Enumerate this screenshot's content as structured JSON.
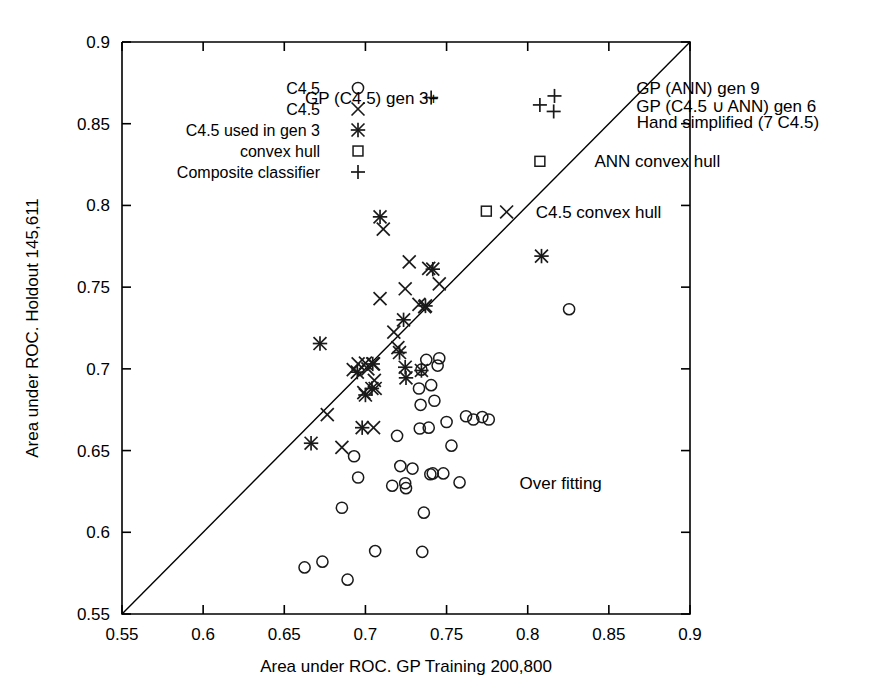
{
  "chart_data": {
    "type": "scatter",
    "title": "",
    "xlabel": "Area under ROC. GP Training 200,800",
    "ylabel": "Area under ROC. Holdout 145,611",
    "xlim": [
      0.55,
      0.9
    ],
    "ylim": [
      0.55,
      0.9
    ],
    "xticks": [
      "0.55",
      "0.6",
      "0.65",
      "0.7",
      "0.75",
      "0.8",
      "0.85",
      "0.9"
    ],
    "yticks": [
      "0.55",
      "0.6",
      "0.65",
      "0.7",
      "0.75",
      "0.8",
      "0.85",
      "0.9"
    ],
    "xtick_values": [
      0.55,
      0.6,
      0.65,
      0.7,
      0.75,
      0.8,
      0.85,
      0.9
    ],
    "ytick_values": [
      0.55,
      0.6,
      0.65,
      0.7,
      0.75,
      0.8,
      0.85,
      0.9
    ],
    "grid": false,
    "legend_position": "top-left",
    "reference_line": {
      "name": "y = x diagonal",
      "from": [
        0.55,
        0.55
      ],
      "to": [
        0.9,
        0.9
      ]
    },
    "legend": [
      {
        "label": "C4.5",
        "marker": "circle"
      },
      {
        "label": "C4.5",
        "marker": "cross"
      },
      {
        "label": "C4.5 used in gen 3",
        "marker": "star"
      },
      {
        "label": "convex hull",
        "marker": "square"
      },
      {
        "label": "Composite classifier",
        "marker": "plus"
      }
    ],
    "annotations": [
      {
        "text": "GP (C4.5) gen 3+",
        "x": 0.745,
        "y": 0.866
      },
      {
        "text": "GP (ANN) gen 9",
        "x": 0.862,
        "y": 0.872
      },
      {
        "text": "GP (C4.5 ∪ ANN) gen 6",
        "x": 0.862,
        "y": 0.861
      },
      {
        "text": "Hand simplified (7 C4.5)",
        "x": 0.866,
        "y": 0.851
      },
      {
        "text": "ANN convex hull",
        "x": 0.835,
        "y": 0.827
      },
      {
        "text": "C4.5 convex hull",
        "x": 0.8,
        "y": 0.796
      },
      {
        "text": "Over fitting",
        "x": 0.795,
        "y": 0.63
      }
    ],
    "series": [
      {
        "name": "C4.5",
        "marker": "circle",
        "points": [
          [
            0.6625,
            0.5785
          ],
          [
            0.6735,
            0.582
          ],
          [
            0.6855,
            0.615
          ],
          [
            0.689,
            0.571
          ],
          [
            0.693,
            0.6465
          ],
          [
            0.6955,
            0.6335
          ],
          [
            0.706,
            0.5885
          ],
          [
            0.7165,
            0.6285
          ],
          [
            0.7195,
            0.659
          ],
          [
            0.7215,
            0.6405
          ],
          [
            0.7245,
            0.63
          ],
          [
            0.725,
            0.627
          ],
          [
            0.729,
            0.639
          ],
          [
            0.733,
            0.688
          ],
          [
            0.7335,
            0.6635
          ],
          [
            0.734,
            0.678
          ],
          [
            0.7345,
            0.6995
          ],
          [
            0.735,
            0.588
          ],
          [
            0.736,
            0.612
          ],
          [
            0.7375,
            0.7055
          ],
          [
            0.739,
            0.664
          ],
          [
            0.74,
            0.6355
          ],
          [
            0.7405,
            0.69
          ],
          [
            0.7415,
            0.636
          ],
          [
            0.7425,
            0.6805
          ],
          [
            0.7445,
            0.702
          ],
          [
            0.7455,
            0.7065
          ],
          [
            0.748,
            0.636
          ],
          [
            0.75,
            0.6675
          ],
          [
            0.753,
            0.653
          ],
          [
            0.758,
            0.6305
          ],
          [
            0.762,
            0.671
          ],
          [
            0.7665,
            0.669
          ],
          [
            0.772,
            0.6705
          ],
          [
            0.776,
            0.669
          ],
          [
            0.8255,
            0.7365
          ]
        ]
      },
      {
        "name": "C4.5 cross",
        "marker": "cross",
        "points": [
          [
            0.6765,
            0.672
          ],
          [
            0.6855,
            0.652
          ],
          [
            0.6925,
            0.6995
          ],
          [
            0.6955,
            0.703
          ],
          [
            0.699,
            0.6855
          ],
          [
            0.7,
            0.7035
          ],
          [
            0.7015,
            0.7
          ],
          [
            0.705,
            0.703
          ],
          [
            0.7055,
            0.693
          ],
          [
            0.706,
            0.688
          ],
          [
            0.709,
            0.743
          ],
          [
            0.711,
            0.7855
          ],
          [
            0.7175,
            0.7225
          ],
          [
            0.72,
            0.713
          ],
          [
            0.7245,
            0.749
          ],
          [
            0.727,
            0.7655
          ],
          [
            0.733,
            0.7395
          ],
          [
            0.7365,
            0.738
          ],
          [
            0.739,
            0.7615
          ],
          [
            0.7455,
            0.752
          ],
          [
            0.787,
            0.796
          ],
          [
            0.705,
            0.664
          ]
        ]
      },
      {
        "name": "C4.5 used in gen 3",
        "marker": "star",
        "points": [
          [
            0.6665,
            0.6545
          ],
          [
            0.672,
            0.7155
          ],
          [
            0.695,
            0.698
          ],
          [
            0.7,
            0.684
          ],
          [
            0.704,
            0.688
          ],
          [
            0.7045,
            0.703
          ],
          [
            0.709,
            0.793
          ],
          [
            0.721,
            0.71
          ],
          [
            0.7235,
            0.73
          ],
          [
            0.7245,
            0.701
          ],
          [
            0.725,
            0.6945
          ],
          [
            0.7345,
            0.699
          ],
          [
            0.737,
            0.7385
          ],
          [
            0.7415,
            0.761
          ],
          [
            0.8085,
            0.769
          ],
          [
            0.698,
            0.664
          ]
        ]
      },
      {
        "name": "convex hull",
        "marker": "square",
        "points": [
          [
            0.8075,
            0.827
          ],
          [
            0.7745,
            0.7965
          ]
        ]
      },
      {
        "name": "Composite classifier",
        "marker": "plus",
        "points": [
          [
            0.8075,
            0.8615
          ],
          [
            0.8165,
            0.867
          ],
          [
            0.816,
            0.8575
          ],
          [
            0.7405,
            0.866
          ]
        ]
      }
    ]
  }
}
